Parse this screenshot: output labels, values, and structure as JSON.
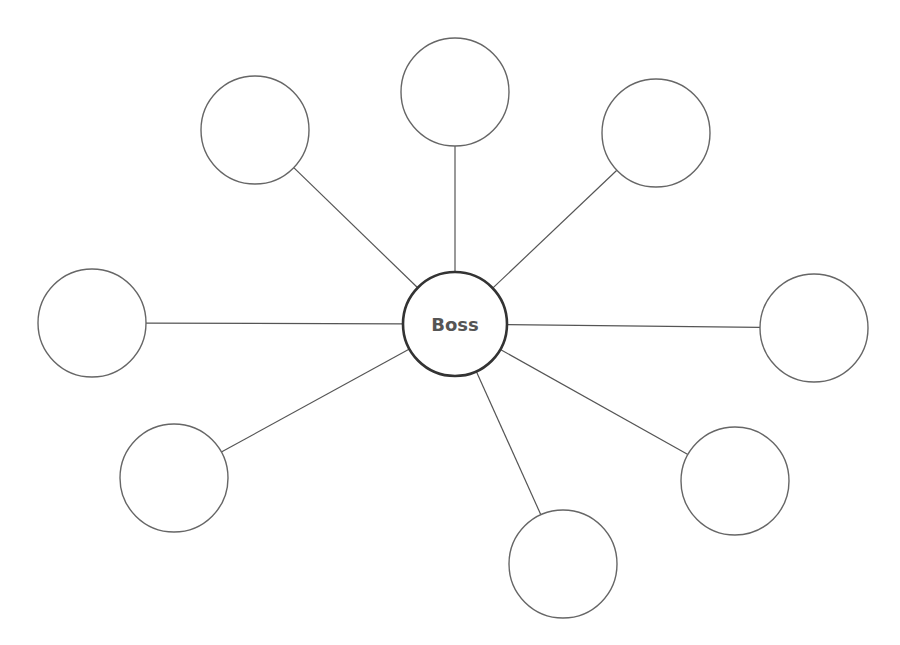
{
  "diagram": {
    "type": "star-spider-map",
    "center": {
      "label": "Boss",
      "cx": 455,
      "cy": 324,
      "r": 52
    },
    "satellites": [
      {
        "id": "top",
        "label": "",
        "cx": 455,
        "cy": 92,
        "r": 54
      },
      {
        "id": "top-left",
        "label": "",
        "cx": 255,
        "cy": 130,
        "r": 54
      },
      {
        "id": "top-right",
        "label": "",
        "cx": 656,
        "cy": 133,
        "r": 54
      },
      {
        "id": "left",
        "label": "",
        "cx": 92,
        "cy": 323,
        "r": 54
      },
      {
        "id": "right",
        "label": "",
        "cx": 814,
        "cy": 328,
        "r": 54
      },
      {
        "id": "bottom-left",
        "label": "",
        "cx": 174,
        "cy": 478,
        "r": 54
      },
      {
        "id": "bottom",
        "label": "",
        "cx": 563,
        "cy": 564,
        "r": 54
      },
      {
        "id": "bottom-right",
        "label": "",
        "cx": 735,
        "cy": 481,
        "r": 54
      }
    ],
    "colors": {
      "background": "#ffffff",
      "line": "#555555",
      "node_stroke": "#666666",
      "center_stroke": "#333333",
      "center_text": "#555555"
    }
  }
}
